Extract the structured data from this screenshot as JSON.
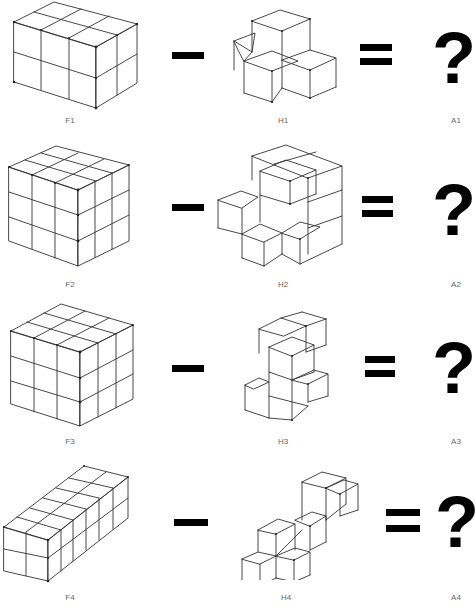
{
  "rows": [
    {
      "figure_label": "F1",
      "hole_label": "H1",
      "answer_label": "A1",
      "minus": "−",
      "equals": "=",
      "answer": "?",
      "figure_desc": "3x2x2 block of cubes (3 wide, 2 deep, 2 high)",
      "hole_desc": "4 cubes in plus-like corner arrangement"
    },
    {
      "figure_label": "F2",
      "hole_label": "H2",
      "answer_label": "A2",
      "minus": "−",
      "equals": "=",
      "answer": "?",
      "figure_desc": "3x3x3 cube",
      "hole_desc": "irregular multi-cube shape"
    },
    {
      "figure_label": "F3",
      "hole_label": "H3",
      "answer_label": "A3",
      "minus": "−",
      "equals": "=",
      "answer": "?",
      "figure_desc": "3x3x3 cube",
      "hole_desc": "zig-zag column of cubes"
    },
    {
      "figure_label": "F4",
      "hole_label": "H4",
      "answer_label": "A4",
      "minus": "−",
      "equals": "=",
      "answer": "?",
      "figure_desc": "2x6x2 long bar of cubes",
      "hole_desc": "staircase diagonal of cubes"
    }
  ]
}
